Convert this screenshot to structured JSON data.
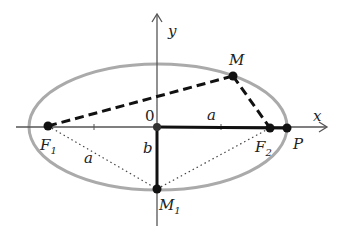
{
  "diagram": {
    "colors": {
      "axis": "#555555",
      "ellipse": "#aaaaaa",
      "stroke": "#111111",
      "point": "#111111",
      "text": "#222222"
    },
    "axes": {
      "x_label": "x",
      "y_label": "y",
      "origin_label": "0"
    },
    "points": {
      "F1": {
        "label": "F",
        "sub": "1"
      },
      "F2": {
        "label": "F",
        "sub": "2"
      },
      "M": {
        "label": "M"
      },
      "M1": {
        "label": "M",
        "sub": "1"
      },
      "P": {
        "label": "P"
      }
    },
    "segment_labels": {
      "a_top": "a",
      "a_bottom": "a",
      "b": "b"
    }
  }
}
